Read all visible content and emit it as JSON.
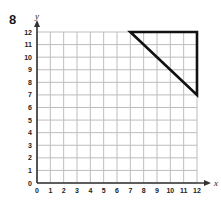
{
  "problem_number": "8",
  "axes": {
    "x_label": "x",
    "y_label": "y"
  },
  "colors": {
    "grid": "#bdbdbd",
    "axis": "#333333",
    "shape": "#111111",
    "text": "#222222"
  },
  "chart_data": {
    "type": "scatter",
    "title": "",
    "xlabel": "x",
    "ylabel": "y",
    "xlim": [
      0,
      12
    ],
    "ylim": [
      0,
      12
    ],
    "grid": true,
    "x_ticks": [
      "0",
      "1",
      "2",
      "3",
      "4",
      "5",
      "6",
      "7",
      "8",
      "9",
      "10",
      "11",
      "12"
    ],
    "y_ticks": [
      "0",
      "1",
      "2",
      "3",
      "4",
      "5",
      "6",
      "7",
      "8",
      "9",
      "10",
      "11",
      "12"
    ],
    "shapes": [
      {
        "name": "triangle",
        "vertices": [
          [
            7,
            12
          ],
          [
            12,
            12
          ],
          [
            12,
            7
          ]
        ],
        "closed": true
      }
    ]
  }
}
